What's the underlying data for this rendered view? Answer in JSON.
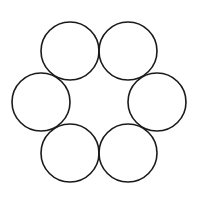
{
  "diagram": {
    "type": "circle-ring",
    "canvas": {
      "width": 199,
      "height": 205,
      "background": "#ffffff"
    },
    "stroke_color": "#1a1a1a",
    "stroke_width": 1.6,
    "fill": "none",
    "radius": 29,
    "circles": [
      {
        "id": "top-left",
        "cx": 70,
        "cy": 51
      },
      {
        "id": "top-right",
        "cx": 128,
        "cy": 51
      },
      {
        "id": "left",
        "cx": 41,
        "cy": 102
      },
      {
        "id": "right",
        "cx": 157,
        "cy": 102
      },
      {
        "id": "bottom-left",
        "cx": 70,
        "cy": 153
      },
      {
        "id": "bottom-right",
        "cx": 128,
        "cy": 153
      }
    ]
  }
}
